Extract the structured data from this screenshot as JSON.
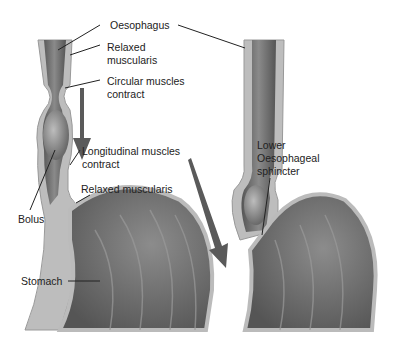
{
  "labels": {
    "oesophagus": "Oesophagus",
    "relaxed_muscularis_1_a": "Relaxed",
    "relaxed_muscularis_1_b": "muscularis",
    "circular_a": "Circular muscles",
    "circular_b": "contract",
    "longitudinal_a": "Longitudinal muscles",
    "longitudinal_b": "contract",
    "relaxed_muscularis_2": "Relaxed muscularis",
    "bolus": "Bolus",
    "stomach": "Stomach",
    "les_a": "Lower",
    "les_b": "Oesophageal",
    "les_c": "sphincter"
  },
  "colors": {
    "wall_outer": "#b9b9b9",
    "wall_inner": "#e6e6e6",
    "lumen": "#6d6d6d",
    "stomach": "#777777",
    "arrow": "#5a5a5a",
    "leader": "#222222"
  }
}
